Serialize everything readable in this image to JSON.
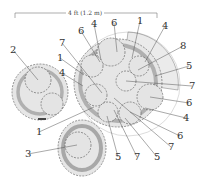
{
  "scale_bar": {
    "label": "4 ft (1.2 m)"
  },
  "colors": {
    "canopy_fill": "#e4e4e4",
    "canopy_stroke": "#555555",
    "mature_ring": "#b5b5b5",
    "large_zone_fill": "#ececec",
    "background": "#ffffff"
  },
  "callouts": [
    {
      "id": "c1",
      "text": "6",
      "x": 78,
      "y": 34,
      "tx": 100,
      "ty": 62
    },
    {
      "id": "c2",
      "text": "4",
      "x": 91,
      "y": 27,
      "tx": 101,
      "ty": 60
    },
    {
      "id": "c3",
      "text": "6",
      "x": 111,
      "y": 26,
      "tx": 117,
      "ty": 52
    },
    {
      "id": "c4",
      "text": "1",
      "x": 137,
      "y": 24,
      "tx": 132,
      "ty": 58
    },
    {
      "id": "c5",
      "text": "4",
      "x": 162,
      "y": 29,
      "tx": 145,
      "ty": 62
    },
    {
      "id": "c6",
      "text": "8",
      "x": 180,
      "y": 49,
      "tx": 138,
      "ty": 70
    },
    {
      "id": "c7",
      "text": "5",
      "x": 186,
      "y": 69,
      "tx": 155,
      "ty": 76
    },
    {
      "id": "c8",
      "text": "7",
      "x": 189,
      "y": 89,
      "tx": 126,
      "ty": 81
    },
    {
      "id": "c9",
      "text": "2",
      "x": 10,
      "y": 53,
      "tx": 38,
      "ty": 80
    },
    {
      "id": "c10",
      "text": "7",
      "x": 59,
      "y": 46,
      "tx": 102,
      "ty": 93
    },
    {
      "id": "c11",
      "text": "1",
      "x": 57,
      "y": 61,
      "tx": 84,
      "ty": 75
    },
    {
      "id": "c12",
      "text": "4",
      "x": 59,
      "y": 76,
      "tx": 83,
      "ty": 86
    },
    {
      "id": "c13",
      "text": "1",
      "x": 36,
      "y": 135,
      "tx": 94,
      "ty": 107
    },
    {
      "id": "c14",
      "text": "3",
      "x": 25,
      "y": 157,
      "tx": 77,
      "ty": 145
    },
    {
      "id": "c15",
      "text": "6",
      "x": 186,
      "y": 106,
      "tx": 150,
      "ty": 97
    },
    {
      "id": "c16",
      "text": "4",
      "x": 183,
      "y": 121,
      "tx": 145,
      "ty": 108
    },
    {
      "id": "c17",
      "text": "6",
      "x": 177,
      "y": 139,
      "tx": 130,
      "ty": 112
    },
    {
      "id": "c18",
      "text": "7",
      "x": 168,
      "y": 150,
      "tx": 114,
      "ty": 98
    },
    {
      "id": "c19",
      "text": "5",
      "x": 115,
      "y": 160,
      "tx": 107,
      "ty": 116
    },
    {
      "id": "c20",
      "text": "7",
      "x": 134,
      "y": 160,
      "tx": 114,
      "ty": 110
    },
    {
      "id": "c21",
      "text": "5",
      "x": 154,
      "y": 160,
      "tx": 125,
      "ty": 118
    }
  ]
}
